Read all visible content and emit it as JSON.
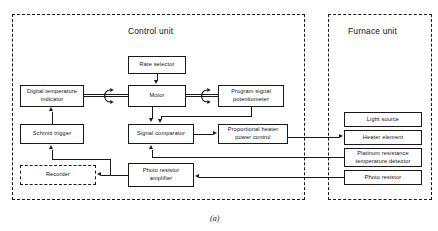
{
  "figure": {
    "caption": "(a)",
    "units": [
      {
        "id": "control",
        "title": "Control unit"
      },
      {
        "id": "furnace",
        "title": "Furnace unit"
      }
    ]
  },
  "control_unit": {
    "title": "Control unit",
    "blocks": {
      "rate_selector": "Rate selector",
      "digital_temperature_indicator": "Digital temperature\nindicator",
      "digital_temperature_indicator_line1": "Digital temperature",
      "digital_temperature_indicator_line2": "indicator",
      "motor": "Motor",
      "program_signal_potentiometer_line1": "Program signal",
      "program_signal_potentiometer_line2": "potentiometer",
      "schmitt_trigger": "Schmitt trigger",
      "signal_comparator": "Signal comparator",
      "proportional_heater_power_control_line1": "Proportional heater",
      "proportional_heater_power_control_line2": "power control",
      "recorder": "Recorder",
      "photo_resistor_amplifier_line1": "Photo resistor",
      "photo_resistor_amplifier_line2": "amplifier"
    }
  },
  "furnace_unit": {
    "title": "Furnace unit",
    "blocks": {
      "light_source": "Light source",
      "heater_element": "Heater element",
      "platinum_rtd_line1": "Platinum resistance",
      "platinum_rtd_line2": "temperature detector",
      "photo_resistor": "Photo resistor"
    }
  },
  "colors": {
    "line": "#1a1a1a",
    "background": "#ffffff",
    "text": "#111111"
  }
}
